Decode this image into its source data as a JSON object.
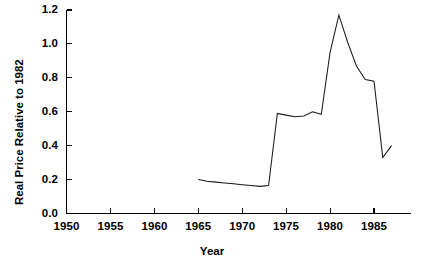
{
  "chart_data": {
    "type": "line",
    "title": "",
    "xlabel": "Year",
    "ylabel": "Real Price Relative to 1982",
    "xlim": [
      1950,
      1988
    ],
    "ylim": [
      0.0,
      1.2
    ],
    "xticks": [
      1950,
      1955,
      1960,
      1965,
      1970,
      1975,
      1980,
      1985
    ],
    "xtick_labels": [
      "1950",
      "1955",
      "1960",
      "1965",
      "1970",
      "1975",
      "1980",
      "1985"
    ],
    "yticks": [
      0.0,
      0.2,
      0.4,
      0.6,
      0.8,
      1.0,
      1.2
    ],
    "ytick_labels": [
      "0.0",
      "0.2",
      "0.4",
      "0.6",
      "0.8",
      "1.0",
      "1.2"
    ],
    "grid": false,
    "legend": null,
    "line_color": "#1a1a1a",
    "series": [
      {
        "name": "Real Price Relative to 1982",
        "x": [
          1965,
          1966,
          1967,
          1968,
          1969,
          1970,
          1971,
          1972,
          1973,
          1974,
          1975,
          1976,
          1977,
          1978,
          1979,
          1980,
          1981,
          1982,
          1983,
          1984,
          1985,
          1986,
          1987
        ],
        "values": [
          0.2,
          0.19,
          0.185,
          0.18,
          0.175,
          0.17,
          0.165,
          0.16,
          0.165,
          0.59,
          0.58,
          0.57,
          0.575,
          0.6,
          0.585,
          0.95,
          1.17,
          1.01,
          0.87,
          0.79,
          0.78,
          0.33,
          0.4
        ]
      }
    ]
  }
}
